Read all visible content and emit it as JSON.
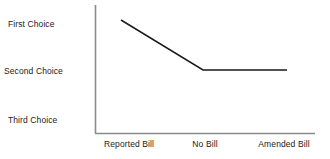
{
  "chart_data": {
    "type": "line",
    "title": "",
    "subtitle": "",
    "xlabel": "",
    "ylabel": "",
    "categories": [
      "Reported Bill",
      "No Bill",
      "Amended Bill"
    ],
    "y_tick_labels": [
      "First Choice",
      "Second Choice",
      "Third Choice"
    ],
    "y_scale": "ordinal",
    "ylim": [
      "First Choice",
      "Third Choice"
    ],
    "grid": false,
    "legend": false,
    "legend_position": "none",
    "series": [
      {
        "name": "Preference",
        "values": [
          "First Choice",
          "Second Choice",
          "Second Choice"
        ],
        "numeric_ranks": [
          1,
          2,
          2
        ],
        "color": "#1a1a1a",
        "line_width": 1
      }
    ],
    "annotations": [],
    "axis_color": "#8a8a8a",
    "background_color": "#ffffff"
  },
  "axes": {
    "y_axis_name": "choice-axis",
    "x_axis_name": "bill-version-axis"
  }
}
